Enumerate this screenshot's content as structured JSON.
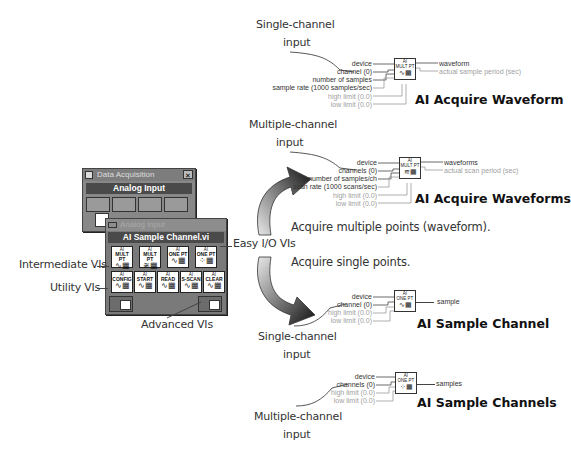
{
  "palette": {
    "back_window": {
      "title": "Data Acquisition",
      "close_glyph": "✕",
      "subheader": "Analog Input"
    },
    "front_window": {
      "title": "Analog Input",
      "subheader": "AI Sample Channel.vi",
      "easy_io_icons": [
        {
          "top": "AI",
          "label": "MULT PT",
          "name": "ai-acquire-waveform-icon"
        },
        {
          "top": "AI",
          "label": "MULT PT",
          "name": "ai-acquire-waveforms-icon"
        },
        {
          "top": "AI",
          "label": "ONE PT",
          "name": "ai-sample-channel-icon"
        },
        {
          "top": "AI",
          "label": "ONE PT",
          "name": "ai-sample-channels-icon"
        }
      ],
      "intermediate_icons": [
        {
          "top": "AI",
          "label": "CONFIG",
          "name": "ai-config-icon"
        },
        {
          "top": "AI",
          "label": "START",
          "name": "ai-start-icon"
        },
        {
          "top": "AI",
          "label": "READ",
          "name": "ai-read-icon"
        },
        {
          "top": "AI",
          "label": "S-SCAN",
          "name": "ai-single-scan-icon"
        },
        {
          "top": "AI",
          "label": "CLEAR",
          "name": "ai-clear-icon"
        }
      ]
    }
  },
  "callouts": {
    "intermediate": "Intermediate VIs",
    "utility": "Utility VIs",
    "advanced": "Advanced VIs",
    "easy_io": "Easy I/O VIs",
    "acquire_multiple": "Acquire multiple points (waveform).",
    "acquire_single": "Acquire single points."
  },
  "diagrams": [
    {
      "title": "AI Acquire Waveform",
      "note_line1": "Single-channel",
      "note_line2": "input",
      "icon_label": "MULT PT",
      "inputs": [
        {
          "label": "device",
          "style": "dark"
        },
        {
          "label": "channel (0)",
          "style": "dark"
        },
        {
          "label": "number of samples",
          "style": "dark"
        },
        {
          "label": "sample rate (1000 samples/sec)",
          "style": "dark"
        },
        {
          "label": "high limit (0.0)",
          "style": "gray"
        },
        {
          "label": "low limit (0.0)",
          "style": "gray"
        }
      ],
      "outputs": [
        {
          "label": "waveform",
          "style": "dark"
        },
        {
          "label": "actual sample period (sec)",
          "style": "gray"
        }
      ]
    },
    {
      "title": "AI Acquire Waveforms",
      "note_line1": "Multiple-channel",
      "note_line2": "input",
      "icon_label": "MULT PT",
      "inputs": [
        {
          "label": "device",
          "style": "dark"
        },
        {
          "label": "channels (0)",
          "style": "dark"
        },
        {
          "label": "number of samples/ch",
          "style": "dark"
        },
        {
          "label": "scan rate (1000 scans/sec)",
          "style": "dark"
        },
        {
          "label": "high limit (0.0)",
          "style": "gray"
        },
        {
          "label": "low limit (0.0)",
          "style": "gray"
        }
      ],
      "outputs": [
        {
          "label": "waveforms",
          "style": "dark"
        },
        {
          "label": "actual scan period (sec)",
          "style": "gray"
        }
      ]
    },
    {
      "title": "AI Sample Channel",
      "note_line1": "Single-channel",
      "note_line2": "input",
      "icon_label": "ONE PT",
      "inputs": [
        {
          "label": "device",
          "style": "dark"
        },
        {
          "label": "channel (0)",
          "style": "dark"
        },
        {
          "label": "high limit (0.0)",
          "style": "gray"
        },
        {
          "label": "low limit (0.0)",
          "style": "gray"
        }
      ],
      "outputs": [
        {
          "label": "sample",
          "style": "dark"
        }
      ]
    },
    {
      "title": "AI Sample Channels",
      "note_line1": "Multiple-channel",
      "note_line2": "input",
      "icon_label": "ONE PT",
      "inputs": [
        {
          "label": "device",
          "style": "dark"
        },
        {
          "label": "channels (0)",
          "style": "dark"
        },
        {
          "label": "high limit (0.0)",
          "style": "gray"
        },
        {
          "label": "low limit (0.0)",
          "style": "gray"
        }
      ],
      "outputs": [
        {
          "label": "samples",
          "style": "dark"
        }
      ]
    }
  ]
}
